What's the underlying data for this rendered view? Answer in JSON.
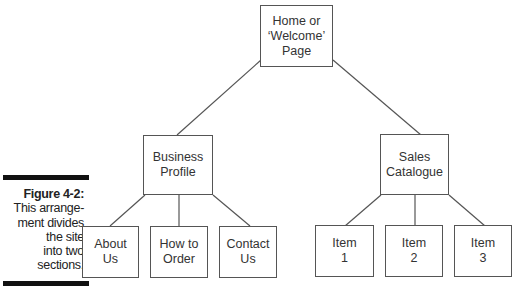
{
  "caption": {
    "title": "Figure 4-2:",
    "lines": [
      "This arrange-",
      "ment divides",
      "the site",
      "into two",
      "sections."
    ]
  },
  "tree": {
    "root": {
      "label": "Home or\n‘Welcome’\nPage"
    },
    "sections": [
      {
        "label": "Business\nProfile",
        "children": [
          "About\nUs",
          "How to\nOrder",
          "Contact\nUs"
        ]
      },
      {
        "label": "Sales\nCatalogue",
        "children": [
          "Item\n1",
          "Item\n2",
          "Item\n3"
        ]
      }
    ]
  }
}
